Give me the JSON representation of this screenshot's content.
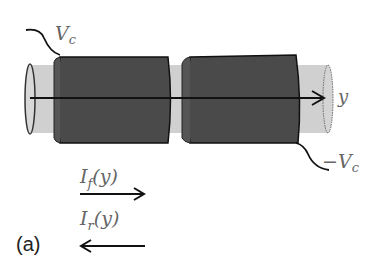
{
  "diagram": {
    "labels": {
      "vc_top": "V",
      "vc_top_sub": "c",
      "vc_bottom_prefix": "−V",
      "vc_bottom_sub": "c",
      "axis": "y",
      "forward_current": "I",
      "forward_sub": "f",
      "forward_arg": "(y)",
      "reverse_current": "I",
      "reverse_sub": "r",
      "reverse_arg": "(y)",
      "panel": "(a)"
    },
    "colors": {
      "electrode": "#4a4a4a",
      "tube": "#cfcfcf",
      "outline": "#111111",
      "text": "#666666"
    }
  }
}
